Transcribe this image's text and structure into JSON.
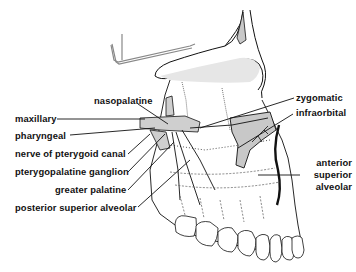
{
  "diagram": {
    "type": "anatomical line drawing",
    "colors": {
      "ink": "#111111",
      "shade": "#c8c8c8",
      "background": "#ffffff"
    },
    "labels": {
      "nasopalatine": "nasopalatine",
      "zygomatic": "zygomatic",
      "maxillary": "maxillary",
      "infraorbital": "infraorbital",
      "pharyngeal": "pharyngeal",
      "nerve_of_pterygoid_canal": "nerve of pterygoid canal",
      "pterygopalatine_ganglion": "pterygopalatine ganglion",
      "greater_palatine": "greater palatine",
      "posterior_superior_alveolar": "posterior superior alveolar",
      "anterior_superior_alveolar_1": "anterior",
      "anterior_superior_alveolar_2": "superior",
      "anterior_superior_alveolar_3": "alveolar"
    }
  }
}
